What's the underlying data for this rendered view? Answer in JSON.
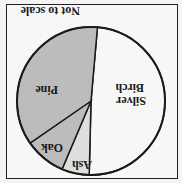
{
  "chart_data": {
    "type": "pie",
    "title": "",
    "annotation": "Not to scale",
    "categories": [
      "Silver Birch",
      "Ash",
      "Oak",
      "Pine"
    ],
    "values": [
      49,
      6,
      9,
      36
    ],
    "colors": [
      "#f7f7f7",
      "#dedede",
      "#bcbcbc",
      "#bcbcbc"
    ],
    "orientation": "rotated 180 degrees",
    "legend": "none (labels inside slices)"
  },
  "labels": {
    "silver_birch_1": "Silver",
    "silver_birch_2": "Birch",
    "ash": "Ash",
    "oak": "Oak",
    "pine": "Pine",
    "note": "Not to scale"
  }
}
